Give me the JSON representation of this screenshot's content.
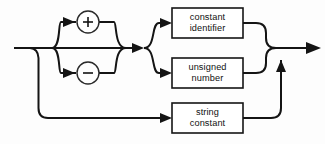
{
  "diagram": {
    "kind": "railroad-syntax-diagram",
    "title": "constant",
    "background_color": "#fdfdfd",
    "line_color": "#141414",
    "box_fill": "#ffffff",
    "entry": {
      "name": "entry-rail",
      "x": 14,
      "y": 48
    },
    "exit": {
      "name": "exit-rail",
      "x": 320,
      "y": 48,
      "arrow": "right"
    },
    "sign_terminals": [
      {
        "id": "plus",
        "label": "+",
        "glyph": "plus-sign",
        "cx": 88,
        "cy": 22,
        "r": 11
      },
      {
        "id": "minus",
        "label": "−",
        "glyph": "minus-sign",
        "cx": 88,
        "cy": 73,
        "r": 11
      }
    ],
    "nonterminals": [
      {
        "id": "constant-identifier",
        "lines": [
          "constant",
          "identifier"
        ],
        "x": 172,
        "y": 8,
        "width": 71,
        "height": 30
      },
      {
        "id": "unsigned-number",
        "lines": [
          "unsigned",
          "number"
        ],
        "x": 172,
        "y": 58,
        "width": 71,
        "height": 30
      },
      {
        "id": "string-constant",
        "lines": [
          "string",
          "constant"
        ],
        "x": 172,
        "y": 103,
        "width": 71,
        "height": 30
      }
    ],
    "arrows": [
      {
        "id": "arrow-to-plus",
        "x": 64,
        "y": 22,
        "dir": "right"
      },
      {
        "id": "arrow-to-minus",
        "x": 64,
        "y": 73,
        "dir": "right"
      },
      {
        "id": "arrow-after-sign-merge",
        "x": 134,
        "y": 48,
        "dir": "right"
      },
      {
        "id": "arrow-to-constant-identifier",
        "x": 166,
        "y": 23,
        "dir": "right"
      },
      {
        "id": "arrow-to-unsigned-number",
        "x": 166,
        "y": 73,
        "dir": "right"
      },
      {
        "id": "arrow-to-string-constant",
        "x": 166,
        "y": 118,
        "dir": "right"
      },
      {
        "id": "arrow-bottom-merge-up",
        "x": 281,
        "y": 68,
        "dir": "up"
      },
      {
        "id": "arrow-exit",
        "x": 310,
        "y": 48,
        "dir": "right"
      }
    ],
    "paths": {
      "main_in": "M14,48 H140",
      "sign_bypass": "M52,48 H124",
      "plus_branch_in": "M52,48 C58,48 58,22 76,22",
      "plus_branch_out": "M100,22 C118,22 118,48 124,48",
      "minus_branch_in": "M52,48 C58,48 58,73 76,73",
      "minus_branch_out": "M100,73 C118,73 118,48 124,48",
      "fork_up": "M146,48 C156,48 152,23 166,23",
      "fork_down": "M146,48 C156,48 152,73 166,73",
      "const_id_out": "M243,23 H254 Q264,23 266,34 Q268,46 278,48",
      "unsigned_out": "M243,73 H254 Q264,73 266,62 Q268,50 278,48",
      "merge_to_exit": "M278,48 H314",
      "bottom_entry": "M38,48 Q38,58 38,68 V108 Q38,118 48,118 H166",
      "string_out": "M243,118 H272 Q281,118 281,108 V62",
      "left_drop": "M30,48 Q38,48 38,58"
    }
  }
}
